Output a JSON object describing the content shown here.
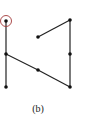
{
  "diagram": {
    "caption": "(b)",
    "nodes": [
      {
        "id": "n1",
        "x": 6,
        "y": 21,
        "highlighted": true
      },
      {
        "id": "n2",
        "x": 38,
        "y": 37
      },
      {
        "id": "n3",
        "x": 70,
        "y": 20
      },
      {
        "id": "n4",
        "x": 6,
        "y": 54
      },
      {
        "id": "n5",
        "x": 70,
        "y": 54
      },
      {
        "id": "n6",
        "x": 38,
        "y": 70
      },
      {
        "id": "n7",
        "x": 6,
        "y": 87
      },
      {
        "id": "n8",
        "x": 70,
        "y": 87
      }
    ],
    "edges": [
      [
        "n1",
        "n4"
      ],
      [
        "n4",
        "n7"
      ],
      [
        "n4",
        "n6"
      ],
      [
        "n6",
        "n8"
      ],
      [
        "n8",
        "n5"
      ],
      [
        "n5",
        "n3"
      ],
      [
        "n3",
        "n2"
      ]
    ],
    "colors": {
      "edge": "#222222",
      "node": "#111111",
      "highlight": "#a33a3a"
    }
  }
}
